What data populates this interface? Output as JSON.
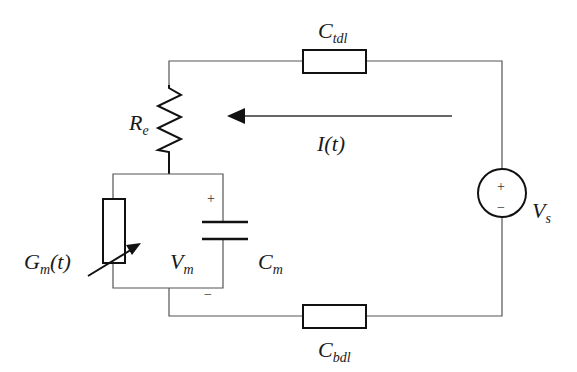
{
  "diagram": {
    "type": "circuit-schematic",
    "labels": {
      "top_capacitor": {
        "main": "C",
        "sub": "tdl"
      },
      "bottom_capacitor": {
        "main": "C",
        "sub": "bdl"
      },
      "resistor": {
        "main": "R",
        "sub": "e"
      },
      "current": {
        "text": "I(t)"
      },
      "conductance": {
        "main": "G",
        "sub": "m",
        "suffix": "(t)"
      },
      "membrane_voltage": {
        "main": "V",
        "sub": "m"
      },
      "membrane_capacitor": {
        "main": "C",
        "sub": "m"
      },
      "source": {
        "main": "V",
        "sub": "s"
      }
    },
    "signs": {
      "membrane_plus": "+",
      "membrane_minus": "−",
      "source_plus": "+",
      "source_minus": "−"
    },
    "components": [
      {
        "id": "C_tdl",
        "kind": "impedance-box",
        "position": "top wire"
      },
      {
        "id": "R_e",
        "kind": "resistor",
        "position": "left branch upper"
      },
      {
        "id": "G_m(t)",
        "kind": "variable-conductance",
        "position": "parallel block left"
      },
      {
        "id": "C_m",
        "kind": "capacitor",
        "position": "parallel block right"
      },
      {
        "id": "V_s",
        "kind": "voltage-source",
        "position": "right wire"
      },
      {
        "id": "C_bdl",
        "kind": "impedance-box",
        "position": "bottom wire"
      }
    ],
    "current_direction": "right-to-left along top loop",
    "colors": {
      "wire": "#555555",
      "component": "#111111",
      "background": "#ffffff"
    }
  }
}
